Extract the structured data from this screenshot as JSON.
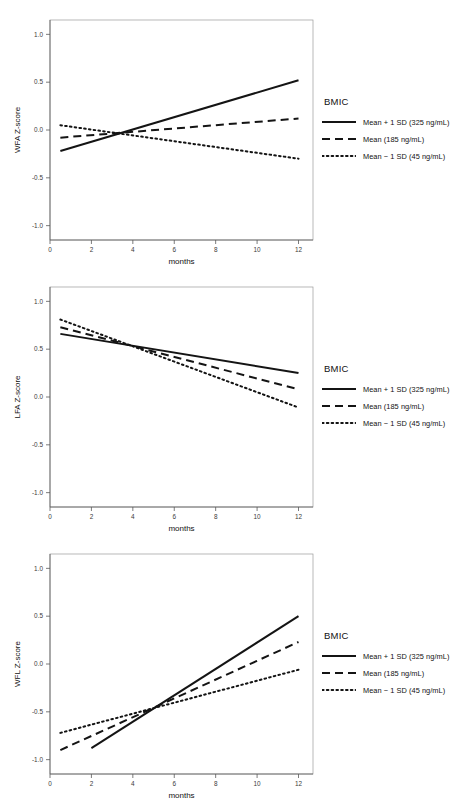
{
  "figure": {
    "panel_count": 3,
    "legend_title": "BMIC",
    "series_names": [
      "Mean + 1 SD (325 ng/mL)",
      "Mean (185 ng/mL)",
      "Mean − 1 SD (45 ng/mL)"
    ],
    "line_styles": [
      "solid",
      "dashed",
      "dotted"
    ],
    "line_color": "#141414"
  },
  "chart_data": [
    {
      "type": "line",
      "title": "",
      "xlabel": "months",
      "ylabel": "WFA Z-score",
      "xlim": [
        0,
        12.7
      ],
      "ylim": [
        -1.15,
        1.15
      ],
      "xticks": [
        0,
        2,
        4,
        6,
        8,
        10,
        12
      ],
      "xticklabels": [
        "0",
        "2",
        "4",
        "6",
        "8",
        "10",
        "12"
      ],
      "yticks": [
        1.0,
        0.5,
        0.0,
        -0.5,
        -1.0
      ],
      "yticklabels": [
        "1.0",
        "0.5",
        "0.0",
        "-0.5",
        "-1.0"
      ],
      "grid": false,
      "legend_position": "right",
      "legend_title": "BMIC",
      "x": [
        0.5,
        12
      ],
      "series": [
        {
          "name": "Mean + 1 SD (325 ng/mL)",
          "style": "solid",
          "values": [
            -0.22,
            0.52
          ]
        },
        {
          "name": "Mean (185 ng/mL)",
          "style": "dashed",
          "values": [
            -0.08,
            0.12
          ]
        },
        {
          "name": "Mean − 1 SD (45 ng/mL)",
          "style": "dotted",
          "values": [
            0.05,
            -0.3
          ]
        }
      ]
    },
    {
      "type": "line",
      "title": "",
      "xlabel": "months",
      "ylabel": "LFA Z-score",
      "xlim": [
        0,
        12.7
      ],
      "ylim": [
        -1.15,
        1.15
      ],
      "xticks": [
        0,
        2,
        4,
        6,
        8,
        10,
        12
      ],
      "xticklabels": [
        "0",
        "2",
        "4",
        "6",
        "8",
        "10",
        "12"
      ],
      "yticks": [
        1.0,
        0.5,
        0.0,
        -0.5,
        -1.0
      ],
      "yticklabels": [
        "1.0",
        "0.5",
        "0.0",
        "-0.5",
        "-1.0"
      ],
      "grid": false,
      "legend_position": "right",
      "legend_title": "BMIC",
      "x": [
        0.5,
        12
      ],
      "series": [
        {
          "name": "Mean + 1 SD (325 ng/mL)",
          "style": "solid",
          "values": [
            0.66,
            0.25
          ]
        },
        {
          "name": "Mean (185 ng/mL)",
          "style": "dashed",
          "values": [
            0.73,
            0.08
          ]
        },
        {
          "name": "Mean − 1 SD (45 ng/mL)",
          "style": "dotted",
          "values": [
            0.81,
            -0.11
          ]
        }
      ]
    },
    {
      "type": "line",
      "title": "",
      "xlabel": "months",
      "ylabel": "WFL Z-score",
      "xlim": [
        0,
        12.7
      ],
      "ylim": [
        -1.15,
        1.15
      ],
      "xticks": [
        0,
        2,
        4,
        6,
        8,
        10,
        12
      ],
      "xticklabels": [
        "0",
        "2",
        "4",
        "6",
        "8",
        "10",
        "12"
      ],
      "yticks": [
        1.0,
        0.5,
        0.0,
        -0.5,
        -1.0
      ],
      "yticklabels": [
        "1.0",
        "0.5",
        "0.0",
        "-0.5",
        "-1.0"
      ],
      "grid": false,
      "legend_position": "right",
      "legend_title": "BMIC",
      "series": [
        {
          "name": "Mean + 1 SD (325 ng/mL)",
          "style": "solid",
          "x": [
            2.0,
            12
          ],
          "values": [
            -0.88,
            0.5
          ]
        },
        {
          "name": "Mean (185 ng/mL)",
          "style": "dashed",
          "x": [
            0.5,
            12
          ],
          "values": [
            -0.9,
            0.23
          ]
        },
        {
          "name": "Mean − 1 SD (45 ng/mL)",
          "style": "dotted",
          "x": [
            0.5,
            12
          ],
          "values": [
            -0.72,
            -0.06
          ]
        }
      ]
    }
  ]
}
